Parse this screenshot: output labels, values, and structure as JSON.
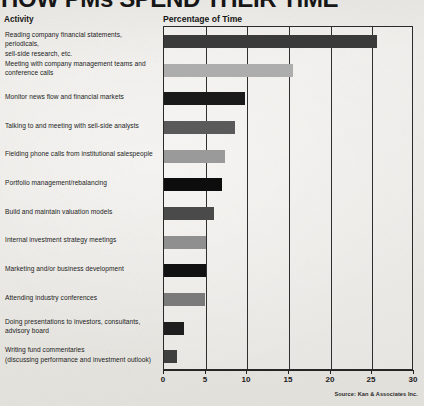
{
  "title": "HOW PMs SPEND THEIR TIME",
  "headers": {
    "activity": "Activity",
    "percentage": "Percentage of Time"
  },
  "source": "Source: Kan & Associates Inc.",
  "chart_data": {
    "type": "bar",
    "orientation": "horizontal",
    "title": "Percentage of Time",
    "xlabel": "",
    "ylabel": "Activity",
    "xlim": [
      0,
      30
    ],
    "xticks": [
      0,
      5,
      10,
      15,
      20,
      25,
      30
    ],
    "xtick_labels": [
      "0",
      "5",
      "10",
      "15",
      "20",
      "25",
      "30"
    ],
    "grid": true,
    "legend": false,
    "categories": [
      "Reading company financial statements, periodicals, sell-side research, etc.",
      "Meeting with company management teams and conference calls",
      "Monitor news flow and financial markets",
      "Talking to and meeting with sell-side analysts",
      "Fielding phone calls from institutional salespeople",
      "Portfolio management/rebalancing",
      "Build and maintain valuation models",
      "Internal investment strategy meetings",
      "Marketing and/or business development",
      "Attending industry conferences",
      "Doing presentations to investors, consultants, advisory board",
      "Writing fund commentaries (discussing performance and investment outlook)"
    ],
    "values": [
      25.5,
      15.5,
      9.7,
      8.5,
      7.3,
      7.0,
      6.0,
      5.0,
      5.0,
      4.9,
      2.4,
      1.6
    ],
    "bar_colors": [
      "#3a3a3a",
      "#adadad",
      "#1a1a1a",
      "#5a5a5a",
      "#9a9a9a",
      "#0d0d0d",
      "#4a4a4a",
      "#8f8f8f",
      "#111111",
      "#7a7a7a",
      "#1e1e1e",
      "#3f3f3f"
    ]
  },
  "rows": [
    {
      "lines": [
        "Reading company financial statements, periodicals,",
        "sell-side research, etc."
      ],
      "value": 25.5,
      "color": "#3a3a3a"
    },
    {
      "lines": [
        "Meeting with company management teams and",
        "conference calls"
      ],
      "value": 15.5,
      "color": "#adadad"
    },
    {
      "lines": [
        "Monitor news flow and financial markets"
      ],
      "value": 9.7,
      "color": "#1a1a1a"
    },
    {
      "lines": [
        "Talking to and meeting with sell-side analysts"
      ],
      "value": 8.5,
      "color": "#5a5a5a"
    },
    {
      "lines": [
        "Fielding phone calls from institutional salespeople"
      ],
      "value": 7.3,
      "color": "#9a9a9a"
    },
    {
      "lines": [
        "Portfolio management/rebalancing"
      ],
      "value": 7.0,
      "color": "#0d0d0d"
    },
    {
      "lines": [
        "Build and maintain valuation models"
      ],
      "value": 6.0,
      "color": "#4a4a4a"
    },
    {
      "lines": [
        "Internal investment strategy meetings"
      ],
      "value": 5.0,
      "color": "#8f8f8f"
    },
    {
      "lines": [
        "Marketing and/or business development"
      ],
      "value": 5.0,
      "color": "#111111"
    },
    {
      "lines": [
        "Attending industry conferences"
      ],
      "value": 4.9,
      "color": "#7a7a7a"
    },
    {
      "lines": [
        "Doing presentations to investors, consultants,",
        "advisory board"
      ],
      "value": 2.4,
      "color": "#1e1e1e"
    },
    {
      "lines": [
        "Writing fund commentaries",
        "(discussing performance and investment outlook)"
      ],
      "value": 1.6,
      "color": "#3f3f3f"
    }
  ]
}
